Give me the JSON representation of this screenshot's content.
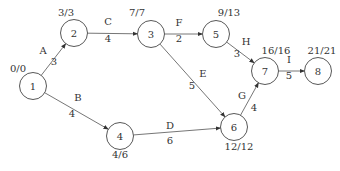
{
  "diagram": {
    "type": "activity-on-arrow network (CPM)",
    "nodes": [
      {
        "id": "1",
        "label": "1",
        "x": 33,
        "y": 86,
        "times": "0/0",
        "times_pos": [
          18,
          72
        ]
      },
      {
        "id": "2",
        "label": "2",
        "x": 74,
        "y": 33,
        "times": "3/3",
        "times_pos": [
          66,
          16
        ]
      },
      {
        "id": "3",
        "label": "3",
        "x": 151,
        "y": 34,
        "times": "7/7",
        "times_pos": [
          137,
          16
        ]
      },
      {
        "id": "4",
        "label": "4",
        "x": 120,
        "y": 136,
        "times": "4/6",
        "times_pos": [
          120,
          158
        ]
      },
      {
        "id": "5",
        "label": "5",
        "x": 216,
        "y": 34,
        "times": "9/13",
        "times_pos": [
          229,
          16
        ]
      },
      {
        "id": "6",
        "label": "6",
        "x": 234,
        "y": 127,
        "times": "12/12",
        "times_pos": [
          239,
          150
        ]
      },
      {
        "id": "7",
        "label": "7",
        "x": 265,
        "y": 71,
        "times": "16/16",
        "times_pos": [
          276,
          54
        ]
      },
      {
        "id": "8",
        "label": "8",
        "x": 318,
        "y": 71,
        "times": "21/21",
        "times_pos": [
          322,
          54
        ]
      }
    ],
    "edges": [
      {
        "activity": "A",
        "duration": "3",
        "from": "1",
        "to": "2",
        "label_pos": [
          43,
          54
        ],
        "dur_pos": [
          54,
          65
        ]
      },
      {
        "activity": "B",
        "duration": "4",
        "from": "1",
        "to": "4",
        "label_pos": [
          78,
          101
        ],
        "dur_pos": [
          72,
          117
        ]
      },
      {
        "activity": "C",
        "duration": "4",
        "from": "2",
        "to": "3",
        "label_pos": [
          108,
          25
        ],
        "dur_pos": [
          108,
          42
        ]
      },
      {
        "activity": "D",
        "duration": "6",
        "from": "4",
        "to": "6",
        "label_pos": [
          170,
          129
        ],
        "dur_pos": [
          170,
          144
        ]
      },
      {
        "activity": "E",
        "duration": "5",
        "from": "3",
        "to": "6",
        "label_pos": [
          203,
          77
        ],
        "dur_pos": [
          192,
          89
        ]
      },
      {
        "activity": "F",
        "duration": "2",
        "from": "3",
        "to": "5",
        "label_pos": [
          179,
          26
        ],
        "dur_pos": [
          179,
          42
        ]
      },
      {
        "activity": "G",
        "duration": "4",
        "from": "6",
        "to": "7",
        "label_pos": [
          242,
          99
        ],
        "dur_pos": [
          254,
          111
        ]
      },
      {
        "activity": "H",
        "duration": "3",
        "from": "5",
        "to": "7",
        "label_pos": [
          246,
          45
        ],
        "dur_pos": [
          237,
          57
        ]
      },
      {
        "activity": "I",
        "duration": "5",
        "from": "7",
        "to": "8",
        "label_pos": [
          289,
          63
        ],
        "dur_pos": [
          289,
          79
        ]
      }
    ]
  }
}
